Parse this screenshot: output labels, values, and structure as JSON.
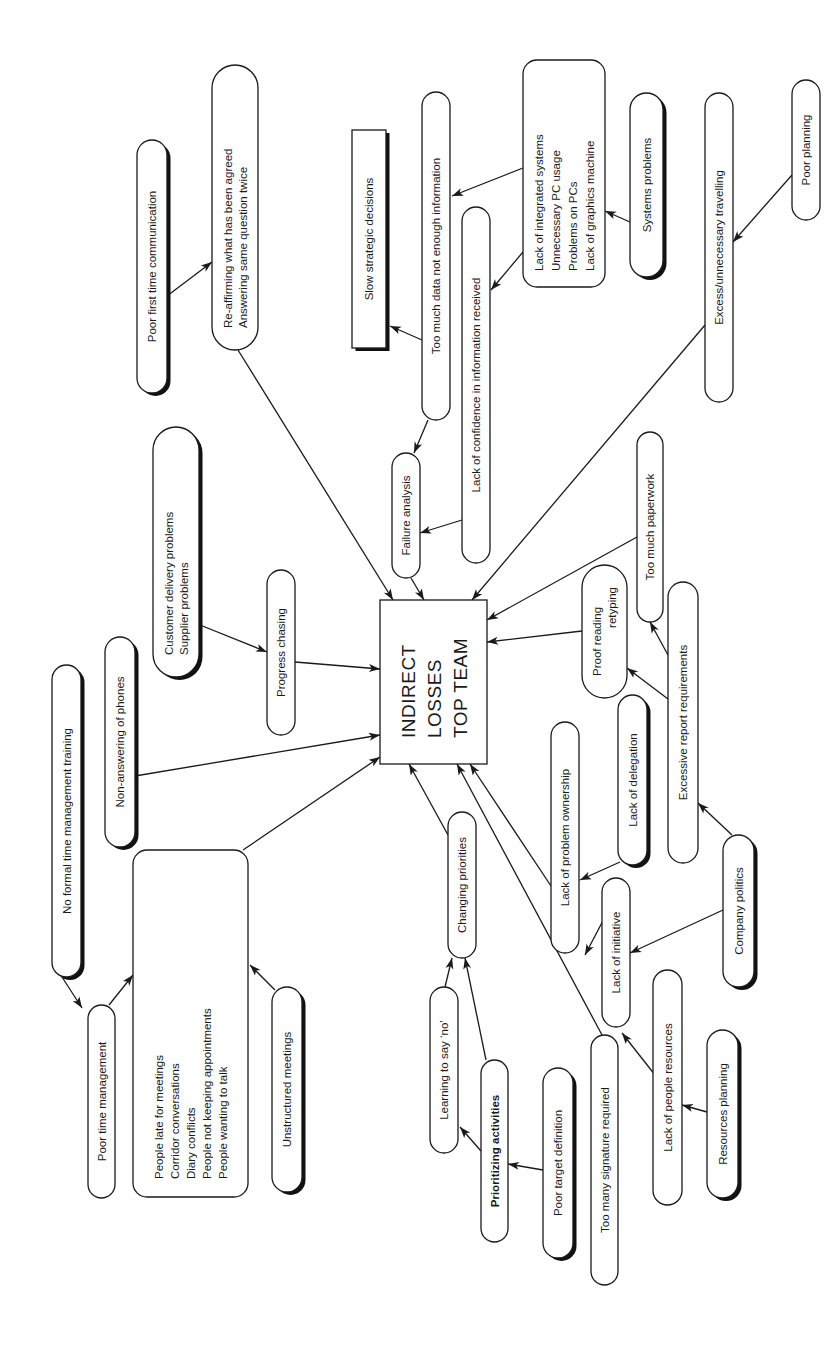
{
  "diagram": {
    "center": {
      "id": "center",
      "lines": [
        "INDIRECT",
        "LOSSES",
        "TOP TEAM"
      ]
    },
    "nodes": [
      {
        "id": "poor-first-time-communication",
        "lines": [
          "Poor first time communication"
        ],
        "shadow": true
      },
      {
        "id": "re-affirming",
        "lines": [
          "Re-affirming what has been agreed",
          "Answering same question twice"
        ],
        "shadow": false
      },
      {
        "id": "slow-strategic-decisions",
        "lines": [
          "Slow strategic decisions"
        ],
        "shadow": true
      },
      {
        "id": "too-much-data",
        "lines": [
          "Too much data not enough information"
        ],
        "shadow": false
      },
      {
        "id": "lack-of-confidence",
        "lines": [
          "Lack of confidence in information received"
        ],
        "shadow": false
      },
      {
        "id": "systems-list",
        "lines": [
          "Lack of integrated systems",
          "Unnecessary PC usage",
          "Problems on PCs",
          "Lack of graphics machine"
        ],
        "shadow": false
      },
      {
        "id": "systems-problems",
        "lines": [
          "Systems problems"
        ],
        "shadow": true
      },
      {
        "id": "excess-travelling",
        "lines": [
          "Excess/unnecessary travelling"
        ],
        "shadow": false
      },
      {
        "id": "poor-planning",
        "lines": [
          "Poor planning"
        ],
        "shadow": false
      },
      {
        "id": "customer-delivery",
        "lines": [
          "Customer delivery problems",
          "Supplier problems"
        ],
        "shadow": true
      },
      {
        "id": "progress-chasing",
        "lines": [
          "Progress chasing"
        ],
        "shadow": false
      },
      {
        "id": "failure-analysis",
        "lines": [
          "Failure analysis"
        ],
        "shadow": false
      },
      {
        "id": "non-answering-phones",
        "lines": [
          "Non-answering of phones"
        ],
        "shadow": true
      },
      {
        "id": "no-formal-training",
        "lines": [
          "No formal time management training"
        ],
        "shadow": true
      },
      {
        "id": "poor-time-management",
        "lines": [
          "Poor time management"
        ],
        "shadow": false
      },
      {
        "id": "meetings-list",
        "lines": [
          "People late for meetings",
          "Corridor conversations",
          "Diary conflicts",
          "People not keeping appointments",
          "People wanting to talk"
        ],
        "shadow": false
      },
      {
        "id": "unstructured-meetings",
        "lines": [
          "Unstructured meetings"
        ],
        "shadow": true
      },
      {
        "id": "too-much-paperwork",
        "lines": [
          "Too much paperwork"
        ],
        "shadow": false
      },
      {
        "id": "proof-reading",
        "lines": [
          "Proof reading",
          "retyping"
        ],
        "shadow": false
      },
      {
        "id": "excessive-report",
        "lines": [
          "Excessive report requirements"
        ],
        "shadow": false
      },
      {
        "id": "lack-of-delegation",
        "lines": [
          "Lack of delegation"
        ],
        "shadow": true
      },
      {
        "id": "lack-of-problem-ownership",
        "lines": [
          "Lack of problem ownership"
        ],
        "shadow": false
      },
      {
        "id": "company-politics",
        "lines": [
          "Company politics"
        ],
        "shadow": true
      },
      {
        "id": "changing-priorities",
        "lines": [
          "Changing priorities"
        ],
        "shadow": false
      },
      {
        "id": "lack-of-initiative",
        "lines": [
          "Lack of initiative"
        ],
        "shadow": false
      },
      {
        "id": "learning-to-say-no",
        "lines": [
          "Learning to say ‘no’"
        ],
        "shadow": false
      },
      {
        "id": "prioritizing-activities",
        "lines": [
          "Prioritizing activities"
        ],
        "shadow": false,
        "bold": true
      },
      {
        "id": "poor-target-definition",
        "lines": [
          "Poor target definition"
        ],
        "shadow": true
      },
      {
        "id": "too-many-signature",
        "lines": [
          "Too many signature required"
        ],
        "shadow": false
      },
      {
        "id": "lack-of-people-resources",
        "lines": [
          "Lack of people resources"
        ],
        "shadow": false
      },
      {
        "id": "resources-planning",
        "lines": [
          "Resources planning"
        ],
        "shadow": true
      }
    ],
    "edges": [
      {
        "from": "poor-first-time-communication",
        "to": "re-affirming"
      },
      {
        "from": "re-affirming",
        "to": "center"
      },
      {
        "from": "too-much-data",
        "to": "slow-strategic-decisions"
      },
      {
        "from": "too-much-data",
        "to": "failure-analysis"
      },
      {
        "from": "systems-list",
        "to": "too-much-data"
      },
      {
        "from": "systems-list",
        "to": "lack-of-confidence"
      },
      {
        "from": "systems-problems",
        "to": "systems-list"
      },
      {
        "from": "poor-planning",
        "to": "excess-travelling"
      },
      {
        "from": "excess-travelling",
        "to": "center"
      },
      {
        "from": "lack-of-confidence",
        "to": "failure-analysis"
      },
      {
        "from": "failure-analysis",
        "to": "center"
      },
      {
        "from": "customer-delivery",
        "to": "progress-chasing"
      },
      {
        "from": "progress-chasing",
        "to": "center"
      },
      {
        "from": "non-answering-phones",
        "to": "center"
      },
      {
        "from": "meetings-list",
        "to": "center"
      },
      {
        "from": "no-formal-training",
        "to": "poor-time-management"
      },
      {
        "from": "poor-time-management",
        "to": "meetings-list"
      },
      {
        "from": "unstructured-meetings",
        "to": "meetings-list"
      },
      {
        "from": "too-much-paperwork",
        "to": "center"
      },
      {
        "from": "proof-reading",
        "to": "center"
      },
      {
        "from": "excessive-report",
        "to": "too-much-paperwork"
      },
      {
        "from": "excessive-report",
        "to": "proof-reading"
      },
      {
        "from": "company-politics",
        "to": "excessive-report"
      },
      {
        "from": "company-politics",
        "to": "lack-of-initiative"
      },
      {
        "from": "lack-of-delegation",
        "to": "lack-of-problem-ownership"
      },
      {
        "from": "lack-of-problem-ownership",
        "to": "center"
      },
      {
        "from": "lack-of-initiative",
        "to": "lack-of-problem-ownership"
      },
      {
        "from": "changing-priorities",
        "to": "center"
      },
      {
        "from": "too-many-signature",
        "to": "center"
      },
      {
        "from": "learning-to-say-no",
        "to": "changing-priorities"
      },
      {
        "from": "prioritizing-activities",
        "to": "changing-priorities"
      },
      {
        "from": "prioritizing-activities",
        "to": "learning-to-say-no"
      },
      {
        "from": "poor-target-definition",
        "to": "prioritizing-activities"
      },
      {
        "from": "lack-of-people-resources",
        "to": "lack-of-initiative"
      },
      {
        "from": "resources-planning",
        "to": "lack-of-people-resources"
      }
    ]
  }
}
